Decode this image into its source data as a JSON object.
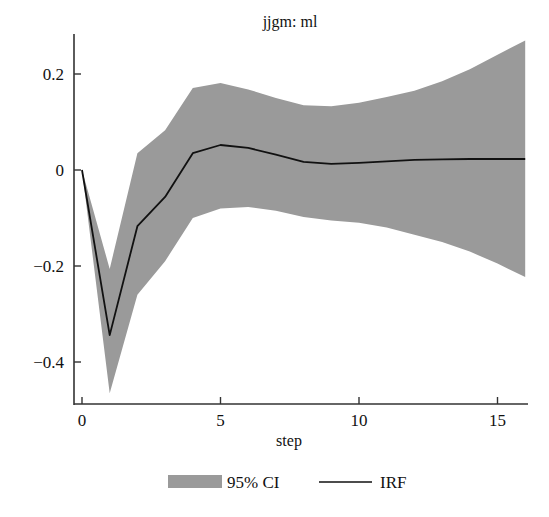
{
  "chart_data": {
    "type": "line",
    "title": "jjgm: ml",
    "xlabel": "step",
    "ylabel": "",
    "xlim": [
      0,
      16
    ],
    "ylim": [
      -0.48,
      0.28
    ],
    "xticks": [
      0,
      5,
      10,
      15
    ],
    "xtick_labels": [
      "0",
      "5",
      "10",
      "15"
    ],
    "yticks": [
      0.2,
      0,
      -0.2,
      -0.4
    ],
    "ytick_labels": [
      "0.2",
      "0",
      "−0.2",
      "−0.4"
    ],
    "grid": false,
    "legend_position": "bottom",
    "x": [
      0,
      1,
      2,
      3,
      4,
      5,
      6,
      7,
      8,
      9,
      10,
      11,
      12,
      13,
      14,
      15,
      16
    ],
    "series": [
      {
        "name": "IRF",
        "kind": "line",
        "color": "#111111",
        "values": [
          0,
          -0.344,
          -0.117,
          -0.056,
          0.035,
          0.052,
          0.046,
          0.032,
          0.017,
          0.013,
          0.015,
          0.018,
          0.021,
          0.022,
          0.023,
          0.023,
          0.023
        ]
      },
      {
        "name": "95% CI upper",
        "kind": "band-upper",
        "values": [
          0,
          -0.206,
          0.035,
          0.083,
          0.171,
          0.181,
          0.168,
          0.15,
          0.135,
          0.133,
          0.14,
          0.152,
          0.165,
          0.185,
          0.21,
          0.24,
          0.27
        ]
      },
      {
        "name": "95% CI lower",
        "kind": "band-lower",
        "values": [
          0,
          -0.465,
          -0.26,
          -0.19,
          -0.1,
          -0.08,
          -0.077,
          -0.085,
          -0.098,
          -0.105,
          -0.11,
          -0.12,
          -0.135,
          -0.15,
          -0.17,
          -0.195,
          -0.223
        ]
      }
    ],
    "legend": [
      {
        "label": "95% CI",
        "kind": "band",
        "color": "#9a9a9a"
      },
      {
        "label": "IRF",
        "kind": "line",
        "color": "#111111"
      }
    ]
  },
  "colors": {
    "band": "#9a9a9a",
    "line": "#111111",
    "axis": "#333333"
  }
}
